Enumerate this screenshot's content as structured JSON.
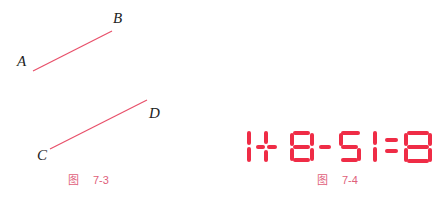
{
  "figure_7_3": {
    "caption_word": "图",
    "caption_number": "7-3",
    "line_color": "#e8506a",
    "segments": [
      {
        "name": "AB",
        "start_label": "A",
        "end_label": "B",
        "x1": 33,
        "y1": 71,
        "x2": 112,
        "y2": 31
      },
      {
        "name": "CD",
        "start_label": "C",
        "end_label": "D",
        "x1": 50,
        "y1": 149,
        "x2": 147,
        "y2": 100
      }
    ],
    "labels": {
      "A": "A",
      "B": "B",
      "C": "C",
      "D": "D"
    }
  },
  "figure_7_4": {
    "caption_word": "图",
    "caption_number": "7-4",
    "equation": "1+8-51=8",
    "digit_color": "#ef2c46"
  },
  "caption_color": "#e0607a"
}
